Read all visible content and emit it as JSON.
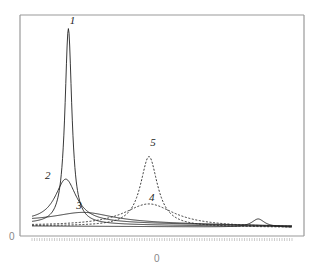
{
  "chart_data": {
    "type": "line",
    "title": "",
    "xlabel": "0",
    "ylabel": "0",
    "x_range": [
      0,
      100
    ],
    "y_range": [
      0,
      100
    ],
    "grid": false,
    "legend": "none (curves labeled inline 1–5)",
    "axis_labels": {
      "y_origin": "0",
      "x_center": "0"
    },
    "series": [
      {
        "name": "1",
        "style": "solid",
        "peak_x": 14,
        "peak_y": 97,
        "width": 1.6,
        "baseline": 2
      },
      {
        "name": "2",
        "style": "solid",
        "peak_x": 13,
        "peak_y": 24,
        "width": 5,
        "baseline": 3
      },
      {
        "name": "3",
        "style": "solid",
        "peak_x": 20,
        "peak_y": 8,
        "width": 14,
        "baseline": 3
      },
      {
        "name": "4",
        "style": "dashed",
        "peak_x": 45,
        "peak_y": 12,
        "width": 12,
        "baseline": 1
      },
      {
        "name": "5",
        "style": "dashed",
        "peak_x": 45,
        "peak_y": 35,
        "width": 4,
        "baseline": 1
      },
      {
        "name": "6",
        "style": "solid",
        "peak_x": 87,
        "peak_y": 5,
        "width": 3,
        "baseline": 1,
        "unlabeled": true
      }
    ],
    "labels": [
      {
        "text": "1",
        "x": 14.5,
        "y": 99
      },
      {
        "text": "2",
        "x": 5,
        "y": 24
      },
      {
        "text": "3",
        "x": 17,
        "y": 9
      },
      {
        "text": "4",
        "x": 45,
        "y": 13
      },
      {
        "text": "5",
        "x": 45.5,
        "y": 40
      }
    ]
  }
}
